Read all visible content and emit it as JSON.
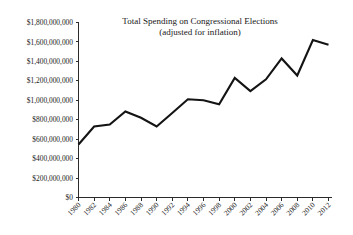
{
  "chart_data": {
    "type": "line",
    "title": "Total Spending on Congressional Elections",
    "subtitle": "(adjusted for inflation)",
    "xlabel": "",
    "ylabel": "",
    "grid": false,
    "legend": "none",
    "xlim": [
      1980,
      2012
    ],
    "ylim": [
      0,
      1800000000
    ],
    "categories": [
      "1980",
      "1982",
      "1984",
      "1986",
      "1988",
      "1990",
      "1992",
      "1994",
      "1996",
      "1998",
      "2000",
      "2002",
      "2004",
      "2006",
      "2008",
      "2010",
      "2012"
    ],
    "x": [
      1980,
      1982,
      1984,
      1986,
      1988,
      1990,
      1992,
      1994,
      1996,
      1998,
      2000,
      2002,
      2004,
      2006,
      2008,
      2010,
      2012
    ],
    "values": [
      545000000,
      730000000,
      750000000,
      885000000,
      820000000,
      730000000,
      870000000,
      1010000000,
      1000000000,
      960000000,
      1230000000,
      1095000000,
      1215000000,
      1430000000,
      1255000000,
      1620000000,
      1570000000
    ],
    "ytick_values": [
      0,
      200000000,
      400000000,
      600000000,
      800000000,
      1000000000,
      1200000000,
      1400000000,
      1600000000,
      1800000000
    ],
    "ytick_labels": [
      "$0",
      "$200,000,000",
      "$400,000,000",
      "$600,000,000",
      "$800,000,000",
      "$1,000,000,000",
      "$1,200,000,000",
      "$1,400,000,000",
      "$1,600,000,000",
      "$1,800,000,000"
    ],
    "line_color": "#141414",
    "background_color": "#ffffff",
    "axis_color": "#2b2b2b"
  }
}
